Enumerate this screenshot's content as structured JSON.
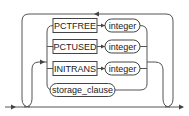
{
  "diagram": {
    "type": "syntax-railroad",
    "keywords": [
      {
        "label": "PCTFREE",
        "param": "integer"
      },
      {
        "label": "PCTUSED",
        "param": "integer"
      },
      {
        "label": "INITRANS",
        "param": "integer"
      }
    ],
    "nonterminal": {
      "label": "storage_clause"
    },
    "loop": "repeatable",
    "colors": {
      "stroke": "#444444",
      "text": "#222222",
      "background": "#ffffff"
    }
  }
}
